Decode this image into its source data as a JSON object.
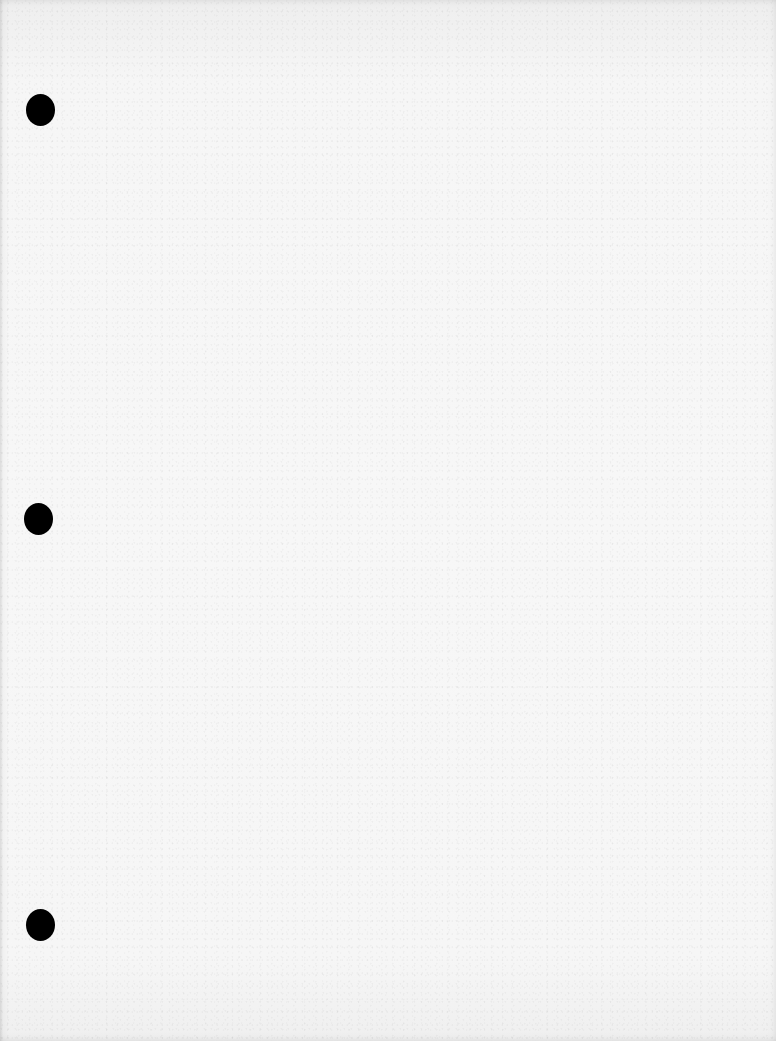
{
  "page": {
    "type": "blank-hole-punched-sheet",
    "text_content": "",
    "paper_color": "#f4f4f4",
    "hole_color": "#000000",
    "punch_holes": [
      {
        "position": "top",
        "x": 40,
        "y": 110
      },
      {
        "position": "middle",
        "x": 38,
        "y": 518
      },
      {
        "position": "bottom",
        "x": 40,
        "y": 925
      }
    ]
  }
}
